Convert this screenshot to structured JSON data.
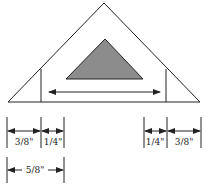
{
  "diagram": {
    "colors": {
      "line": "#222222",
      "fill_shaded": "#8c8c8c",
      "background": "#ffffff"
    },
    "dimensions": {
      "left_top": [
        {
          "label": "3/8\""
        },
        {
          "label": "1/4\""
        }
      ],
      "left_bottom": {
        "label": "5/8\""
      },
      "right_top": [
        {
          "label": "1/4\""
        },
        {
          "label": "3/8\""
        }
      ]
    }
  }
}
